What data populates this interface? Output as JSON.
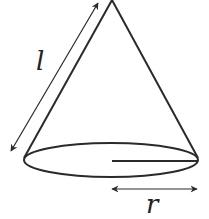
{
  "diagram": {
    "labels": {
      "slant_height": "l",
      "radius": "r"
    },
    "colors": {
      "stroke": "#2a2a2a",
      "background": "#ffffff"
    }
  }
}
